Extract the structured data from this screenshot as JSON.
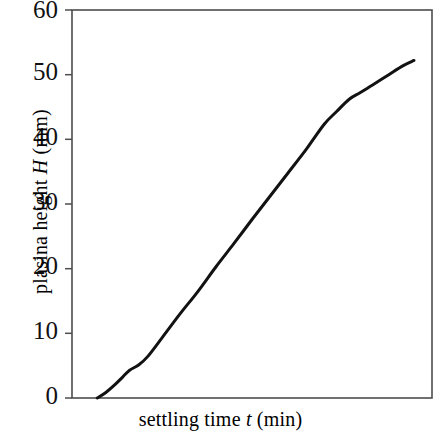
{
  "chart_data": {
    "type": "line",
    "title": "",
    "xlabel": "settling time t (min)",
    "ylabel": "plasina height H (mm)",
    "xlabel_parts": {
      "pre": "settling time ",
      "var": "t",
      "post": " (min)"
    },
    "ylabel_parts": {
      "pre": "plasina height ",
      "var": "H",
      "post": " (mm)"
    },
    "xlim": [
      0,
      100
    ],
    "ylim": [
      0,
      60
    ],
    "ytick_labels": [
      "0",
      "10",
      "20",
      "30",
      "40",
      "50",
      "60"
    ],
    "ytick_values": [
      0,
      10,
      20,
      30,
      40,
      50,
      60
    ],
    "xtick_labels": [],
    "xtick_values": [],
    "grid": false,
    "legend": false,
    "legend_position": "none",
    "series": [
      {
        "name": "plasma height vs settling time",
        "x": [
          7.0,
          9.5,
          12.0,
          14.0,
          16.0,
          18.5,
          21.0,
          25.0,
          30.0,
          35.0,
          40.0,
          45.0,
          50.0,
          55.0,
          60.0,
          65.0,
          70.0,
          73.5,
          77.0,
          80.0,
          83.5,
          88.0,
          92.0,
          95.0
        ],
        "y": [
          0.0,
          0.9,
          2.1,
          3.2,
          4.3,
          5.1,
          6.4,
          9.3,
          13.0,
          16.5,
          20.3,
          23.9,
          27.6,
          31.2,
          34.8,
          38.4,
          42.3,
          44.3,
          46.2,
          47.2,
          48.4,
          50.0,
          51.4,
          52.2
        ]
      }
    ],
    "curve_color": "#121212",
    "axis_color": "#4d4d4d",
    "background_color": "#ffffff"
  },
  "figure": {
    "plot_left_px": 72,
    "plot_right_px": 432,
    "plot_top_px": 10,
    "plot_bottom_px": 398
  }
}
